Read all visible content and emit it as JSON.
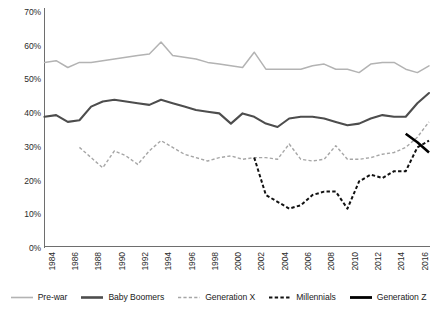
{
  "chart_data": {
    "type": "line",
    "title": "",
    "xlabel": "",
    "ylabel": "",
    "ylim": [
      0,
      70
    ],
    "ytick_labels": [
      "0%",
      "10%",
      "20%",
      "30%",
      "40%",
      "50%",
      "60%",
      "70%"
    ],
    "ytick_values": [
      0,
      10,
      20,
      30,
      40,
      50,
      60,
      70
    ],
    "grid": false,
    "legend_position": "bottom",
    "xlim": [
      1984,
      2017
    ],
    "x": [
      1984,
      1985,
      1986,
      1987,
      1988,
      1989,
      1990,
      1991,
      1992,
      1993,
      1994,
      1995,
      1996,
      1997,
      1998,
      1999,
      2000,
      2001,
      2002,
      2003,
      2004,
      2005,
      2006,
      2007,
      2008,
      2009,
      2010,
      2011,
      2012,
      2013,
      2014,
      2015,
      2016,
      2017
    ],
    "xtick_labels": [
      "1984",
      "1986",
      "1988",
      "1990",
      "1992",
      "1994",
      "1996",
      "1998",
      "2000",
      "2002",
      "2004",
      "2006",
      "2008",
      "2010",
      "2012",
      "2014",
      "2016"
    ],
    "xtick_values": [
      1984,
      1986,
      1988,
      1990,
      1992,
      1994,
      1996,
      1998,
      2000,
      2002,
      2004,
      2006,
      2008,
      2010,
      2012,
      2014,
      2016
    ],
    "series": [
      {
        "name": "Pre-war",
        "color": "#b3b3b3",
        "style": "solid",
        "x": [
          1984,
          1985,
          1986,
          1987,
          1988,
          1989,
          1990,
          1991,
          1992,
          1993,
          1994,
          1995,
          1996,
          1997,
          1998,
          1999,
          2000,
          2001,
          2002,
          2003,
          2004,
          2005,
          2006,
          2007,
          2008,
          2009,
          2010,
          2011,
          2012,
          2013,
          2014,
          2015,
          2016,
          2017
        ],
        "values": [
          54,
          54.5,
          52.5,
          54,
          54,
          54.5,
          55,
          55.5,
          56,
          56.5,
          60,
          56,
          55.5,
          55,
          54,
          53.5,
          53,
          52.5,
          57,
          52,
          52,
          52,
          52,
          53,
          53.5,
          52,
          52,
          51,
          53.5,
          54,
          54,
          52,
          51,
          53
        ]
      },
      {
        "name": "Baby Boomers",
        "color": "#4d4d4d",
        "style": "solid",
        "x": [
          1984,
          1985,
          1986,
          1987,
          1988,
          1989,
          1990,
          1991,
          1992,
          1993,
          1994,
          1995,
          1996,
          1997,
          1998,
          1999,
          2000,
          2001,
          2002,
          2003,
          2004,
          2005,
          2006,
          2007,
          2008,
          2009,
          2010,
          2011,
          2012,
          2013,
          2014,
          2015,
          2016,
          2017
        ],
        "values": [
          38,
          38.5,
          36.5,
          37,
          41,
          42.5,
          43,
          42.5,
          42,
          41.5,
          43,
          42,
          41,
          40,
          39.5,
          39,
          36,
          39,
          38,
          36,
          35,
          37.5,
          38,
          38,
          37.5,
          36.5,
          35.5,
          36,
          37.5,
          38.5,
          38,
          38,
          42,
          45
        ]
      },
      {
        "name": "Generation X",
        "color": "#a6a6a6",
        "style": "dashed",
        "x": [
          1987,
          1988,
          1989,
          1990,
          1991,
          1992,
          1993,
          1994,
          1995,
          1996,
          1997,
          1998,
          1999,
          2000,
          2001,
          2002,
          2003,
          2004,
          2005,
          2006,
          2007,
          2008,
          2009,
          2010,
          2011,
          2012,
          2013,
          2014,
          2015,
          2016,
          2017
        ],
        "values": [
          29,
          26,
          23,
          28,
          26.5,
          24,
          28,
          31,
          29,
          27,
          26,
          25,
          26,
          26.5,
          25.5,
          26,
          26,
          25.5,
          30,
          25.5,
          25,
          25.5,
          29.5,
          25.5,
          25.5,
          26,
          27,
          27.5,
          29,
          32,
          36.5
        ]
      },
      {
        "name": "Millennials",
        "color": "#111111",
        "style": "dashed",
        "x": [
          2002,
          2003,
          2004,
          2005,
          2006,
          2007,
          2008,
          2009,
          2010,
          2011,
          2012,
          2013,
          2014,
          2015,
          2016,
          2017
        ],
        "values": [
          26,
          15,
          13,
          11,
          12,
          15,
          16,
          16,
          11,
          19,
          21,
          20,
          22,
          22,
          29,
          31
        ]
      },
      {
        "name": "Generation Z",
        "color": "#000000",
        "style": "solid-thick",
        "x": [
          2015,
          2016,
          2017
        ],
        "values": [
          33,
          30.5,
          27.5
        ]
      }
    ]
  },
  "legend": {
    "items": [
      {
        "label": "Pre-war",
        "swatch": "line-thin-gray"
      },
      {
        "label": "Baby Boomers",
        "swatch": "line-thick-darkgray"
      },
      {
        "label": "Generation X",
        "swatch": "line-dashed-gray"
      },
      {
        "label": "Millennials",
        "swatch": "line-dashed-black"
      },
      {
        "label": "Generation Z",
        "swatch": "line-thick-black"
      }
    ]
  }
}
